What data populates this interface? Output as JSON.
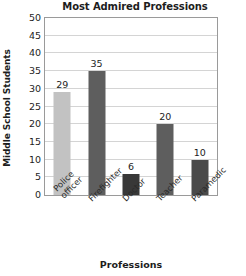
{
  "chart_data": {
    "type": "bar",
    "title": "Most Admired Professions",
    "xlabel": "Professions",
    "ylabel": "Middle School Students",
    "categories": [
      "Police officer",
      "Firefighter",
      "Doctor",
      "Teacher",
      "Paramedic"
    ],
    "category_lines": [
      [
        "Police",
        "officer"
      ],
      [
        "Firefighter"
      ],
      [
        "Doctor"
      ],
      [
        "Teacher"
      ],
      [
        "Paramedic"
      ]
    ],
    "values": [
      29,
      35,
      6,
      20,
      10
    ],
    "value_labels": [
      "29",
      "35",
      "6",
      "20",
      "10"
    ],
    "bar_colors": [
      "#c2c2c2",
      "#5e5e5e",
      "#383838",
      "#5e5e5e",
      "#4a4a4a"
    ],
    "ylim": [
      0,
      50
    ],
    "ytick_step": 5,
    "yticks": [
      "50",
      "45",
      "40",
      "35",
      "30",
      "25",
      "20",
      "15",
      "10",
      "5",
      "0"
    ],
    "grid": true,
    "legend": "none",
    "frame_color": "#9a9a9a",
    "gridline_color": "#d4d4d4",
    "background": "#ffffff"
  }
}
